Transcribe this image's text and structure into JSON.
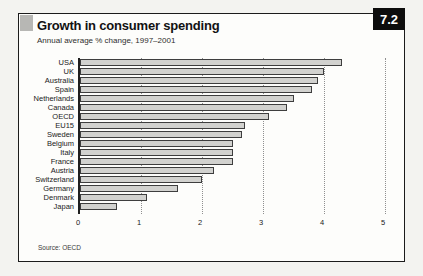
{
  "header": {
    "figure_number": "7.2",
    "title": "Growth in consumer spending",
    "subtitle": "Annual average % change, 1997–2001"
  },
  "footer": {
    "source": "Source: OECD"
  },
  "colors": {
    "page_bg": "#f3f3f0",
    "card_bg": "#fdfdfb",
    "card_border": "#1b1b1b",
    "badge_bg": "#0d0d0d",
    "badge_text": "#ffffff",
    "corner_tab": "#b7b7b4",
    "bar_fill": "#d2d2cf",
    "bar_border": "#3e3e3e",
    "gridline": "#8f8f8f"
  },
  "chart_data": {
    "type": "bar",
    "orientation": "horizontal",
    "title": "Growth in consumer spending",
    "subtitle": "Annual average % change, 1997–2001",
    "categories": [
      "USA",
      "UK",
      "Australia",
      "Spain",
      "Netherlands",
      "Canada",
      "OECD",
      "EU15",
      "Sweden",
      "Belgium",
      "Italy",
      "France",
      "Austria",
      "Switzerland",
      "Germany",
      "Denmark",
      "Japan"
    ],
    "values": [
      4.3,
      4.0,
      3.9,
      3.8,
      3.5,
      3.4,
      3.1,
      2.7,
      2.65,
      2.5,
      2.5,
      2.5,
      2.2,
      2.0,
      1.6,
      1.1,
      0.6
    ],
    "xlabel": "",
    "ylabel": "",
    "xlim": [
      0,
      5
    ],
    "xticks": [
      0,
      1,
      2,
      3,
      4,
      5
    ],
    "grid": "vertical-dotted",
    "legend": "none",
    "source": "Source: OECD"
  }
}
